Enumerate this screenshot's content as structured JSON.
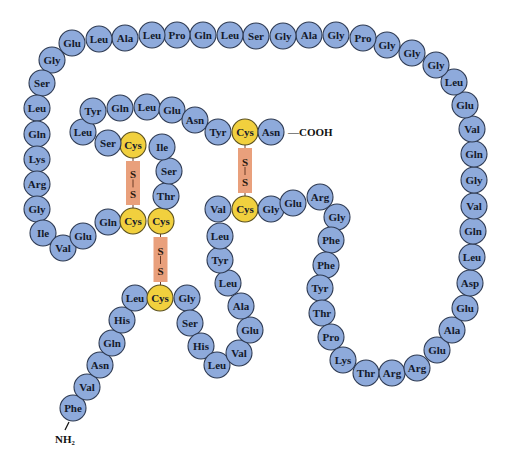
{
  "colors": {
    "residue_fill": "#8eaadb",
    "residue_stroke": "#2e3a52",
    "cysteine_fill": "#f1d03e",
    "cysteine_stroke": "#5a5020",
    "bridge_fill": "#e9a07c",
    "bridge_line": "#6b3a25"
  },
  "termini": {
    "n_terminus": "NH₂",
    "c_terminus": "—COOH"
  },
  "bridge_atom": "S",
  "chains": [
    {
      "name": "chain-a",
      "residues": [
        "Phe",
        "Val",
        "Asn",
        "Gln",
        "His",
        "Leu",
        "Cys",
        "Gly",
        "Ser",
        "His",
        "Leu",
        "Val",
        "Glu",
        "Ala",
        "Leu",
        "Tyr",
        "Leu",
        "Val",
        "Cys",
        "Gly",
        "Glu",
        "Arg",
        "Gly",
        "Phe",
        "Phe",
        "Tyr",
        "Thr",
        "Pro",
        "Lys",
        "Thr",
        "Arg",
        "Arg",
        "Glu",
        "Ala",
        "Glu",
        "Asp",
        "Leu",
        "Gln",
        "Val",
        "Gly",
        "Gln",
        "Val",
        "Glu",
        "Leu",
        "Gly",
        "Gly",
        "Gly",
        "Pro",
        "Gly",
        "Ala",
        "Gly",
        "Ser",
        "Leu",
        "Gln",
        "Pro",
        "Leu",
        "Ala",
        "Leu",
        "Glu",
        "Gly",
        "Ser",
        "Leu",
        "Gln",
        "Lys",
        "Arg",
        "Gly",
        "Ile",
        "Val",
        "Glu",
        "Gln",
        "Cys",
        "Cys",
        "Thr",
        "Ser",
        "Ile",
        "Cys",
        "Ser",
        "Leu",
        "Tyr",
        "Gln",
        "Leu",
        "Glu",
        "Asn",
        "Tyr",
        "Cys",
        "Asn"
      ]
    }
  ],
  "disulfide_bonds": [
    {
      "from": "Cys (Ser-Cys-Ile)",
      "to": "Cys (Gln-Cys-Cys)"
    },
    {
      "from": "Cys (Cys-Cys-Thr)",
      "to": "Cys (Leu-Cys-Gly)"
    },
    {
      "from": "Cys (Tyr-Cys-Asn)",
      "to": "Cys (Val-Cys-Gly)"
    }
  ]
}
